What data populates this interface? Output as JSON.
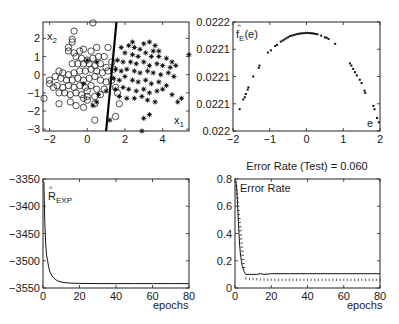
{
  "chart_data": [
    {
      "id": "scatter",
      "type": "scatter",
      "title": "",
      "xlabel": "x1",
      "ylabel": "x2",
      "xlim": [
        -2.35,
        5.4
      ],
      "ylim": [
        -3.1,
        2.9
      ],
      "xticks": [
        -2,
        0,
        2,
        4
      ],
      "yticks": [
        -3,
        -2,
        -1,
        0,
        1,
        2
      ],
      "box": [
        43,
        22,
        189,
        131
      ],
      "boundary_line": {
        "x": [
          1.0,
          1.55
        ],
        "y": [
          -3.1,
          2.9
        ]
      },
      "series": [
        {
          "name": "class 1",
          "marker": "circle",
          "points": [
            [
              0.3,
              2.85
            ],
            [
              -0.7,
              2.4
            ],
            [
              -0.8,
              1.95
            ],
            [
              -1.0,
              1.5
            ],
            [
              -1.0,
              1.3
            ],
            [
              -0.7,
              1.2
            ],
            [
              -0.4,
              1.3
            ],
            [
              -0.2,
              1.4
            ],
            [
              0.2,
              1.3
            ],
            [
              0.5,
              1.5
            ],
            [
              1.1,
              1.5
            ],
            [
              -0.6,
              1.0
            ],
            [
              -0.3,
              0.9
            ],
            [
              0.0,
              0.8
            ],
            [
              0.3,
              0.9
            ],
            [
              0.6,
              1.0
            ],
            [
              0.9,
              1.0
            ],
            [
              1.3,
              0.7
            ],
            [
              -0.8,
              0.6
            ],
            [
              -0.5,
              0.6
            ],
            [
              -0.2,
              0.6
            ],
            [
              0.1,
              0.6
            ],
            [
              0.4,
              0.5
            ],
            [
              0.7,
              0.6
            ],
            [
              1.0,
              0.4
            ],
            [
              -1.5,
              0.2
            ],
            [
              -1.3,
              0.1
            ],
            [
              -1.0,
              0.0
            ],
            [
              -0.7,
              0.1
            ],
            [
              -0.4,
              0.2
            ],
            [
              -0.1,
              0.2
            ],
            [
              0.2,
              0.3
            ],
            [
              0.5,
              0.2
            ],
            [
              0.8,
              0.1
            ],
            [
              1.1,
              0.2
            ],
            [
              -1.7,
              -0.1
            ],
            [
              -1.4,
              -0.2
            ],
            [
              -1.1,
              -0.3
            ],
            [
              -0.8,
              -0.3
            ],
            [
              -0.5,
              -0.2
            ],
            [
              -0.2,
              -0.3
            ],
            [
              0.1,
              -0.2
            ],
            [
              0.4,
              -0.1
            ],
            [
              0.7,
              -0.3
            ],
            [
              1.0,
              -0.4
            ],
            [
              1.3,
              -0.3
            ],
            [
              -2.0,
              -0.3
            ],
            [
              -1.6,
              -0.6
            ],
            [
              -1.3,
              -0.7
            ],
            [
              -1.0,
              -0.6
            ],
            [
              -0.7,
              -0.7
            ],
            [
              -0.4,
              -0.6
            ],
            [
              -0.1,
              -0.7
            ],
            [
              0.2,
              -0.6
            ],
            [
              0.5,
              -0.8
            ],
            [
              0.9,
              -0.8
            ],
            [
              1.5,
              -0.7
            ],
            [
              -1.8,
              -0.7
            ],
            [
              -1.5,
              -1.0
            ],
            [
              -1.2,
              -1.0
            ],
            [
              -0.9,
              -1.1
            ],
            [
              -0.6,
              -1.0
            ],
            [
              -0.3,
              -1.1
            ],
            [
              0.0,
              -1.2
            ],
            [
              0.4,
              -1.2
            ],
            [
              0.7,
              -1.1
            ],
            [
              1.6,
              -1.0
            ],
            [
              -2.3,
              -1.3
            ],
            [
              -1.5,
              -1.6
            ],
            [
              -0.9,
              -1.5
            ],
            [
              -0.6,
              -1.7
            ],
            [
              -0.2,
              -1.3
            ],
            [
              0.0,
              -1.4
            ],
            [
              0.4,
              -1.6
            ],
            [
              1.7,
              -1.6
            ],
            [
              -0.2,
              -1.8
            ],
            [
              0.4,
              -2.5
            ],
            [
              1.5,
              -2.3
            ],
            [
              -2.0,
              -0.5
            ],
            [
              -0.8,
              1.8
            ],
            [
              0.0,
              -0.9
            ],
            [
              1.4,
              0.3
            ]
          ]
        },
        {
          "name": "class 2",
          "marker": "star",
          "points": [
            [
              1.8,
              1.5
            ],
            [
              2.2,
              1.6
            ],
            [
              2.5,
              1.5
            ],
            [
              2.8,
              1.4
            ],
            [
              3.0,
              1.7
            ],
            [
              3.3,
              1.8
            ],
            [
              3.6,
              1.6
            ],
            [
              3.8,
              1.3
            ],
            [
              2.0,
              1.2
            ],
            [
              2.4,
              1.1
            ],
            [
              2.7,
              1.0
            ],
            [
              3.1,
              1.2
            ],
            [
              3.4,
              1.0
            ],
            [
              3.8,
              1.0
            ],
            [
              4.2,
              0.9
            ],
            [
              4.5,
              0.7
            ],
            [
              5.4,
              1.1
            ],
            [
              1.6,
              0.8
            ],
            [
              1.9,
              0.7
            ],
            [
              2.3,
              0.7
            ],
            [
              2.6,
              0.6
            ],
            [
              3.0,
              0.7
            ],
            [
              3.3,
              0.5
            ],
            [
              3.7,
              0.6
            ],
            [
              4.0,
              0.5
            ],
            [
              4.4,
              0.4
            ],
            [
              4.7,
              0.5
            ],
            [
              1.5,
              0.3
            ],
            [
              1.8,
              0.2
            ],
            [
              2.1,
              0.3
            ],
            [
              2.5,
              0.2
            ],
            [
              2.8,
              0.1
            ],
            [
              3.2,
              0.2
            ],
            [
              3.5,
              0.1
            ],
            [
              3.9,
              0.0
            ],
            [
              4.3,
              0.1
            ],
            [
              4.6,
              -0.1
            ],
            [
              1.4,
              -0.2
            ],
            [
              1.7,
              -0.3
            ],
            [
              2.0,
              -0.1
            ],
            [
              2.4,
              -0.3
            ],
            [
              2.7,
              -0.4
            ],
            [
              3.1,
              -0.3
            ],
            [
              3.4,
              -0.5
            ],
            [
              3.8,
              -0.4
            ],
            [
              4.2,
              -0.6
            ],
            [
              1.5,
              -0.8
            ],
            [
              1.9,
              -0.7
            ],
            [
              2.2,
              -0.8
            ],
            [
              2.6,
              -0.9
            ],
            [
              3.0,
              -0.8
            ],
            [
              3.3,
              -1.0
            ],
            [
              3.7,
              -0.9
            ],
            [
              4.0,
              -0.8
            ],
            [
              1.7,
              -1.2
            ],
            [
              2.1,
              -1.3
            ],
            [
              2.5,
              -1.3
            ],
            [
              2.9,
              -1.2
            ],
            [
              3.2,
              -1.4
            ],
            [
              3.6,
              -1.5
            ],
            [
              4.5,
              -1.1
            ],
            [
              5.0,
              -1.3
            ],
            [
              4.8,
              -1.5
            ],
            [
              0.5,
              -1.5
            ],
            [
              0.3,
              -1.7
            ],
            [
              1.2,
              -2.5
            ],
            [
              3.3,
              -2.2
            ],
            [
              3.0,
              -2.4
            ],
            [
              2.9,
              -3.1
            ],
            [
              0.0,
              0.8
            ],
            [
              0.5,
              0.7
            ],
            [
              -0.2,
              -0.5
            ],
            [
              0.6,
              -1.1
            ],
            [
              1.0,
              -0.9
            ],
            [
              2.4,
              1.8
            ],
            [
              3.5,
              1.3
            ]
          ]
        }
      ]
    },
    {
      "id": "density",
      "type": "scatter",
      "title": "",
      "xlabel": "e",
      "ylabel": "f_E(e)",
      "xlim": [
        -2,
        2
      ],
      "ylim": [
        0.0,
        1.0
      ],
      "xticks": [
        -2,
        -1,
        0,
        1,
        2
      ],
      "yticks": [
        0,
        0.25,
        0.5,
        0.75,
        1.0
      ],
      "ytick_labels": [
        "0.022",
        "0.0221",
        "0.0221",
        "0.0221",
        "0.0222"
      ],
      "box": [
        233,
        22,
        380,
        131
      ],
      "points": [
        [
          -1.82,
          0.2
        ],
        [
          -1.72,
          0.29
        ],
        [
          -1.68,
          0.31
        ],
        [
          -1.65,
          0.34
        ],
        [
          -1.6,
          0.38
        ],
        [
          -1.58,
          0.4
        ],
        [
          -1.45,
          0.5
        ],
        [
          -1.3,
          0.58
        ],
        [
          -1.28,
          0.6
        ],
        [
          -1.05,
          0.72
        ],
        [
          -0.97,
          0.74
        ],
        [
          -0.85,
          0.78
        ],
        [
          -0.8,
          0.79
        ],
        [
          -0.7,
          0.82
        ],
        [
          -0.65,
          0.83
        ],
        [
          -0.6,
          0.84
        ],
        [
          -0.55,
          0.85
        ],
        [
          -0.5,
          0.86
        ],
        [
          -0.45,
          0.87
        ],
        [
          -0.4,
          0.875
        ],
        [
          -0.35,
          0.88
        ],
        [
          -0.3,
          0.885
        ],
        [
          -0.25,
          0.89
        ],
        [
          -0.2,
          0.893
        ],
        [
          -0.15,
          0.895
        ],
        [
          -0.1,
          0.897
        ],
        [
          -0.05,
          0.898
        ],
        [
          0.0,
          0.9
        ],
        [
          0.05,
          0.899
        ],
        [
          0.1,
          0.898
        ],
        [
          0.15,
          0.896
        ],
        [
          0.2,
          0.894
        ],
        [
          0.25,
          0.89
        ],
        [
          0.3,
          0.887
        ],
        [
          0.4,
          0.875
        ],
        [
          0.5,
          0.86
        ],
        [
          0.55,
          0.855
        ],
        [
          0.6,
          0.845
        ],
        [
          0.78,
          0.8
        ],
        [
          1.18,
          0.62
        ],
        [
          1.22,
          0.6
        ],
        [
          1.27,
          0.57
        ],
        [
          1.32,
          0.54
        ],
        [
          1.37,
          0.51
        ],
        [
          1.45,
          0.47
        ],
        [
          1.5,
          0.44
        ],
        [
          1.58,
          0.37
        ],
        [
          1.6,
          0.35
        ],
        [
          1.82,
          0.23
        ],
        [
          1.85,
          0.2
        ],
        [
          1.92,
          0.12
        ],
        [
          1.97,
          0.08
        ]
      ]
    },
    {
      "id": "risk",
      "type": "line",
      "title": "",
      "xlabel": "epochs",
      "ylabel": "R_EXP",
      "xlim": [
        0,
        80
      ],
      "ylim": [
        -3550,
        -3350
      ],
      "xticks": [
        0,
        20,
        40,
        60,
        80
      ],
      "yticks": [
        -3550,
        -3500,
        -3450,
        -3400,
        -3350
      ],
      "box": [
        43,
        179,
        189,
        288
      ],
      "x": [
        0.5,
        1,
        1.5,
        2,
        2.5,
        3,
        3.5,
        4,
        5,
        6,
        7,
        8,
        10,
        12,
        15,
        20,
        30,
        40,
        50,
        60,
        70,
        80
      ],
      "values": [
        -3355,
        -3430,
        -3470,
        -3490,
        -3500,
        -3510,
        -3517,
        -3522,
        -3528,
        -3532,
        -3535,
        -3537,
        -3539,
        -3540,
        -3541,
        -3541.5,
        -3542,
        -3542,
        -3542,
        -3542,
        -3542,
        -3542
      ]
    },
    {
      "id": "error",
      "type": "line",
      "title": "Error Rate (Test) = 0.060",
      "xlabel": "epochs",
      "ylabel": "Error Rate",
      "xlim": [
        0,
        80
      ],
      "ylim": [
        0,
        0.8
      ],
      "xticks": [
        0,
        20,
        40,
        60,
        80
      ],
      "yticks": [
        0,
        0.2,
        0.4,
        0.6,
        0.8
      ],
      "box": [
        235,
        179,
        380,
        288
      ],
      "series": [
        {
          "name": "train",
          "style": "solid-dots",
          "x": [
            0.5,
            1,
            1.5,
            2,
            2.5,
            3,
            3.5,
            4,
            5,
            6,
            8,
            10,
            12,
            14,
            16,
            20,
            30,
            40,
            50,
            60,
            70,
            80
          ],
          "values": [
            0.78,
            0.72,
            0.6,
            0.45,
            0.33,
            0.25,
            0.2,
            0.16,
            0.12,
            0.1,
            0.1,
            0.1,
            0.1,
            0.105,
            0.1,
            0.105,
            0.105,
            0.105,
            0.105,
            0.105,
            0.105,
            0.105
          ]
        },
        {
          "name": "test",
          "style": "dotted",
          "x": [
            6,
            8,
            10,
            12,
            14,
            16,
            18,
            20,
            22,
            24,
            26,
            28,
            30,
            32,
            34,
            36,
            38,
            40,
            42,
            44,
            46,
            48,
            50,
            52,
            54,
            56,
            58,
            60,
            62,
            64,
            66,
            68,
            70,
            72,
            74,
            76,
            78,
            80
          ],
          "values": [
            0.07,
            0.065,
            0.065,
            0.065,
            0.062,
            0.062,
            0.06,
            0.06,
            0.06,
            0.06,
            0.06,
            0.06,
            0.06,
            0.06,
            0.06,
            0.06,
            0.06,
            0.06,
            0.06,
            0.06,
            0.06,
            0.06,
            0.06,
            0.06,
            0.06,
            0.06,
            0.06,
            0.06,
            0.06,
            0.06,
            0.06,
            0.06,
            0.06,
            0.06,
            0.06,
            0.06,
            0.06,
            0.06
          ]
        }
      ]
    }
  ],
  "labels": {
    "scatter_x": "x",
    "scatter_x_sub": "1",
    "scatter_y": "x",
    "scatter_y_sub": "2",
    "density_y": "f",
    "density_y_sub": "E",
    "density_y_arg": "(e)",
    "density_x": "e",
    "risk_y": "R",
    "risk_y_sub": "EXP",
    "risk_x": "epochs",
    "error_title": "Error Rate (Test) = 0.060",
    "error_legend": "Error Rate",
    "error_x": "epochs"
  }
}
